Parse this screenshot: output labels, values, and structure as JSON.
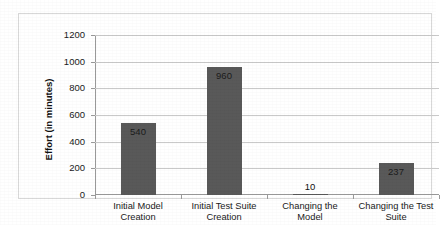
{
  "chart_data": {
    "type": "bar",
    "title": "",
    "xlabel": "",
    "ylabel": "Effort (in minutes)",
    "categories": [
      "Initial Model\nCreation",
      "Initial Test Suite\nCreation",
      "Changing the\nModel",
      "Changing the Test\nSuite"
    ],
    "values": [
      540,
      960,
      10,
      237
    ],
    "data_labels": [
      "540",
      "960",
      "10",
      "237"
    ],
    "ylim": [
      0,
      1200
    ],
    "ytick_labels": [
      "0",
      "200",
      "400",
      "600",
      "800",
      "1000",
      "1200"
    ],
    "ytick_values": [
      0,
      200,
      400,
      600,
      800,
      1000,
      1200
    ],
    "grid": true,
    "legend": false,
    "bar_color": "#595959",
    "gridline_color": "#c9c9c9",
    "axis_color": "#9a9a9a",
    "plot_border_color": "#d8d8d8",
    "background_color": "#ffffff"
  }
}
